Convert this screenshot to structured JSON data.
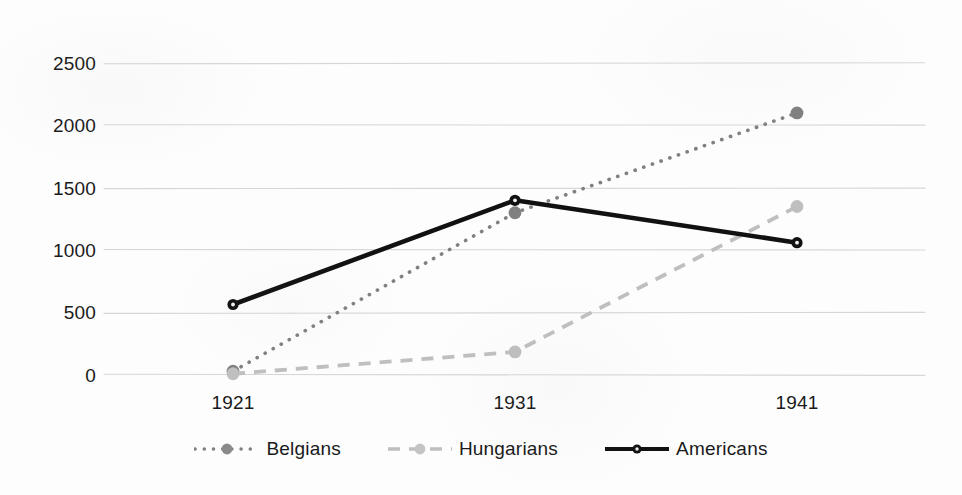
{
  "chart_data": {
    "type": "line",
    "title": "",
    "xlabel": "",
    "ylabel": "",
    "categories": [
      "1921",
      "1931",
      "1941"
    ],
    "ylim": [
      0,
      2500
    ],
    "yticks": [
      0,
      500,
      1000,
      1500,
      2000,
      2500
    ],
    "ytick_labels": [
      "0",
      "500",
      "1000",
      "1500",
      "2000",
      "2500"
    ],
    "grid": true,
    "legend_position": "bottom-center",
    "series": [
      {
        "name": "Belgians",
        "values": [
          30,
          1300,
          2100
        ],
        "color": "#808080",
        "style": "dotted",
        "marker": "circle"
      },
      {
        "name": "Hungarians",
        "values": [
          10,
          185,
          1350
        ],
        "color": "#bfbfbf",
        "style": "dashed",
        "marker": "circle"
      },
      {
        "name": "Americans",
        "values": [
          565,
          1400,
          1060
        ],
        "color": "#111111",
        "style": "solid",
        "marker": "circle"
      }
    ]
  },
  "axes": {
    "y_labels": [
      "2500",
      "2000",
      "1500",
      "1000",
      "500",
      "0"
    ],
    "x_labels": [
      "1921",
      "1931",
      "1941"
    ]
  },
  "legend": {
    "items": [
      {
        "label": "Belgians",
        "color": "#808080",
        "style": "dotted"
      },
      {
        "label": "Hungarians",
        "color": "#bfbfbf",
        "style": "dashed"
      },
      {
        "label": "Americans",
        "color": "#111111",
        "style": "solid"
      }
    ]
  },
  "colors": {
    "background": "#fdfdfd",
    "gridline": "#d6d6d6",
    "text": "#1a1a1a",
    "belgians": "#808080",
    "hungarians": "#bfbfbf",
    "americans": "#111111"
  }
}
